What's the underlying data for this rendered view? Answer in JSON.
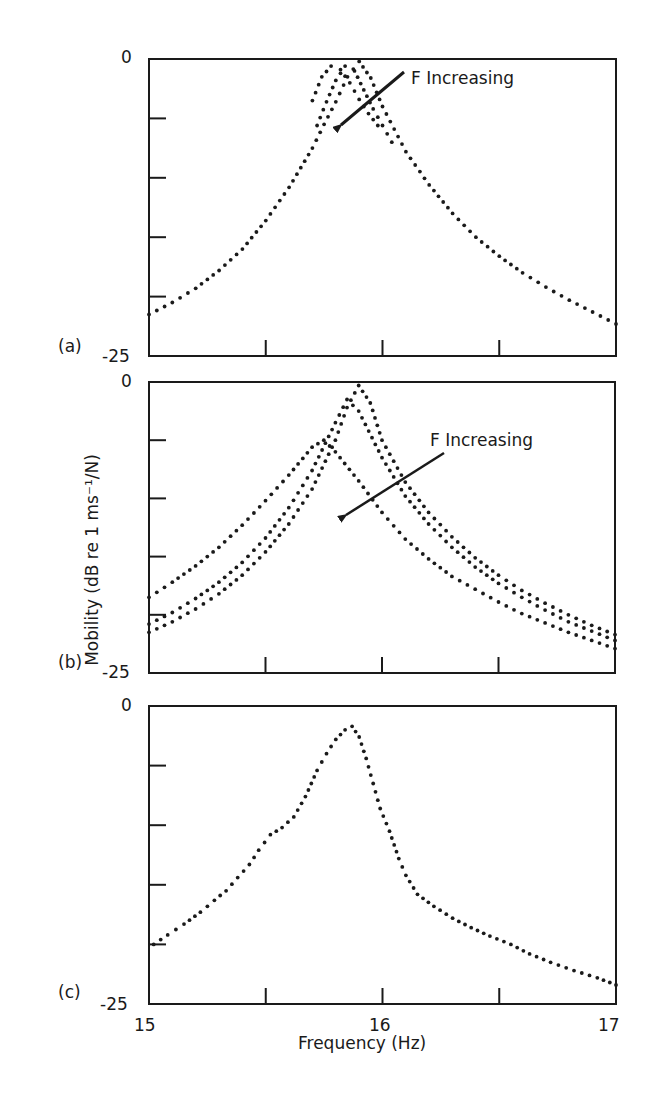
{
  "figure": {
    "ylabel": "Mobility (dB re 1 ms⁻¹/N)",
    "xlabel": "Frequency (Hz)",
    "x_ticks": [
      "15",
      "16",
      "17"
    ],
    "y_top_label": "0",
    "y_bottom_label": "-25",
    "annotation": "F Increasing"
  },
  "colors": {
    "ink": "#1a1a1a",
    "background": "#ffffff"
  },
  "chart_data": [
    {
      "type": "scatter",
      "panel": "(a)",
      "title": "",
      "xlabel": "Frequency (Hz)",
      "ylabel": "Mobility (dB re 1 ms^-1/N)",
      "xlim": [
        15,
        17
      ],
      "ylim": [
        -25,
        0
      ],
      "y_minor_step": 5,
      "x_minor_step": 0.5,
      "annotation": {
        "text": "F Increasing",
        "arrow_from": [
          16.48,
          -0.8
        ],
        "arrow_to": [
          15.82,
          -6.2
        ]
      },
      "series": [
        {
          "name": "F1",
          "x": [
            15.0,
            15.1,
            15.2,
            15.3,
            15.4,
            15.5,
            15.6,
            15.7,
            15.75,
            15.8,
            15.85,
            15.9,
            15.95,
            16.0,
            16.1,
            16.2,
            16.3,
            16.4,
            16.5,
            16.6,
            16.7,
            16.8,
            16.9,
            17.0
          ],
          "y": [
            -21.5,
            -20.5,
            -19.3,
            -17.8,
            -16.0,
            -13.6,
            -10.8,
            -7.5,
            -5.5,
            -3.6,
            -1.5,
            -0.2,
            -1.6,
            -4.0,
            -7.8,
            -10.6,
            -13.0,
            -15.0,
            -16.6,
            -18.0,
            -19.2,
            -20.3,
            -21.3,
            -22.3
          ]
        },
        {
          "name": "F2",
          "x": [
            15.72,
            15.76,
            15.8,
            15.84,
            15.88,
            15.92,
            15.96,
            16.0,
            16.04
          ],
          "y": [
            -5.6,
            -3.6,
            -1.8,
            -0.6,
            -1.0,
            -2.6,
            -4.2,
            -5.6,
            -7.0
          ]
        },
        {
          "name": "F3",
          "x": [
            15.7,
            15.74,
            15.78,
            15.82,
            15.86,
            15.9,
            15.94,
            15.98
          ],
          "y": [
            -3.5,
            -1.5,
            -0.6,
            -0.9,
            -2.0,
            -3.4,
            -4.6,
            -5.6
          ]
        }
      ]
    },
    {
      "type": "scatter",
      "panel": "(b)",
      "title": "",
      "xlim": [
        15,
        17
      ],
      "ylim": [
        -25,
        0
      ],
      "annotation": {
        "text": "F Increasing",
        "arrow_from": [
          16.35,
          -8.5
        ],
        "arrow_to": [
          15.72,
          -13.0
        ]
      },
      "series": [
        {
          "name": "F_low",
          "x": [
            15.0,
            15.1,
            15.2,
            15.3,
            15.4,
            15.5,
            15.6,
            15.7,
            15.75,
            15.8,
            15.9,
            16.0,
            16.1,
            16.2,
            16.3,
            16.4,
            16.5,
            16.6,
            16.7,
            16.8,
            16.9,
            17.0
          ],
          "y": [
            -18.5,
            -17.2,
            -15.8,
            -14.2,
            -12.3,
            -10.2,
            -8.0,
            -5.6,
            -5.0,
            -6.0,
            -8.5,
            -11.2,
            -13.5,
            -15.2,
            -16.7,
            -17.8,
            -18.9,
            -19.9,
            -20.7,
            -21.5,
            -22.2,
            -22.9
          ]
        },
        {
          "name": "F_mid",
          "x": [
            15.0,
            15.1,
            15.2,
            15.3,
            15.4,
            15.5,
            15.6,
            15.7,
            15.8,
            15.85,
            15.9,
            16.0,
            16.1,
            16.2,
            16.3,
            16.4,
            16.5,
            16.6,
            16.7,
            16.8,
            16.9,
            17.0
          ],
          "y": [
            -20.8,
            -19.8,
            -18.6,
            -17.2,
            -15.5,
            -13.4,
            -10.8,
            -7.6,
            -3.5,
            -1.5,
            -2.5,
            -6.5,
            -9.8,
            -12.2,
            -14.2,
            -15.9,
            -17.3,
            -18.5,
            -19.6,
            -20.6,
            -21.4,
            -22.2
          ]
        },
        {
          "name": "F_high",
          "x": [
            15.0,
            15.1,
            15.2,
            15.3,
            15.4,
            15.5,
            15.6,
            15.7,
            15.8,
            15.85,
            15.9,
            15.95,
            16.0,
            16.1,
            16.2,
            16.3,
            16.4,
            16.5,
            16.6,
            16.7,
            16.8,
            16.9,
            17.0
          ],
          "y": [
            -21.5,
            -20.6,
            -19.5,
            -18.2,
            -16.6,
            -14.6,
            -12.2,
            -9.2,
            -5.0,
            -2.2,
            -0.3,
            -1.8,
            -5.0,
            -8.6,
            -11.2,
            -13.3,
            -15.1,
            -16.6,
            -17.9,
            -19.0,
            -20.0,
            -20.9,
            -21.7
          ]
        }
      ]
    },
    {
      "type": "scatter",
      "panel": "(c)",
      "title": "",
      "xlabel": "Frequency (Hz)",
      "xlim": [
        15,
        17
      ],
      "ylim": [
        -25,
        0
      ],
      "x_tick_labels": [
        "15",
        "16",
        "17"
      ],
      "series": [
        {
          "name": "measured",
          "x": [
            15.02,
            15.08,
            15.15,
            15.22,
            15.28,
            15.33,
            15.38,
            15.43,
            15.47,
            15.52,
            15.57,
            15.62,
            15.67,
            15.72,
            15.76,
            15.8,
            15.84,
            15.87,
            15.9,
            15.93,
            15.96,
            15.99,
            16.03,
            16.07,
            16.1,
            16.15,
            16.22,
            16.3,
            16.38,
            16.46,
            16.55,
            16.63,
            16.72,
            16.82,
            16.92,
            17.0
          ],
          "y": [
            -20.0,
            -19.2,
            -18.3,
            -17.3,
            -16.3,
            -15.5,
            -14.4,
            -13.3,
            -12.1,
            -10.8,
            -10.2,
            -9.3,
            -7.6,
            -5.4,
            -4.0,
            -2.8,
            -2.0,
            -1.7,
            -2.6,
            -4.4,
            -6.5,
            -8.6,
            -10.5,
            -12.8,
            -14.2,
            -15.8,
            -16.8,
            -17.8,
            -18.6,
            -19.3,
            -20.0,
            -20.8,
            -21.5,
            -22.2,
            -22.8,
            -23.4
          ]
        }
      ]
    }
  ],
  "panels": [
    {
      "label": "(a)",
      "y_top": "0",
      "y_bottom": "-25",
      "annotation": "F Increasing"
    },
    {
      "label": "(b)",
      "y_top": "0",
      "y_bottom": "-25",
      "annotation": "F Increasing"
    },
    {
      "label": "(c)",
      "y_top": "0",
      "y_bottom": "-25"
    }
  ]
}
